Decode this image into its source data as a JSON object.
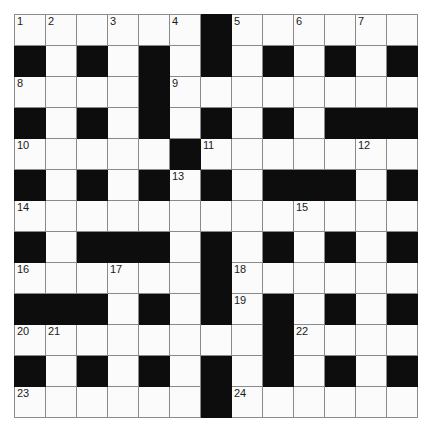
{
  "puzzle": {
    "kind": "crossword-grid",
    "rows": 13,
    "cols": 13,
    "cell_size_px": 30,
    "colors": {
      "block": "#0d0d0d",
      "cell": "#fbfbfb",
      "grid_line": "#8a8a8a",
      "border": "#555555",
      "number_text": "#1a1a1a",
      "page_background": "#ffffff"
    },
    "grid": [
      [
        "white",
        "white",
        "white",
        "white",
        "white",
        "white",
        "black",
        "white",
        "white",
        "white",
        "white",
        "white",
        "white"
      ],
      [
        "black",
        "white",
        "black",
        "white",
        "black",
        "white",
        "black",
        "white",
        "black",
        "white",
        "black",
        "white",
        "black"
      ],
      [
        "white",
        "white",
        "white",
        "white",
        "black",
        "white",
        "white",
        "white",
        "white",
        "white",
        "white",
        "white",
        "white"
      ],
      [
        "black",
        "white",
        "black",
        "white",
        "black",
        "white",
        "black",
        "white",
        "black",
        "white",
        "black",
        "black",
        "black"
      ],
      [
        "white",
        "white",
        "white",
        "white",
        "white",
        "black",
        "white",
        "white",
        "white",
        "white",
        "white",
        "white",
        "white"
      ],
      [
        "black",
        "white",
        "black",
        "white",
        "black",
        "white",
        "black",
        "white",
        "black",
        "black",
        "black",
        "white",
        "black"
      ],
      [
        "white",
        "white",
        "white",
        "white",
        "white",
        "white",
        "white",
        "white",
        "white",
        "white",
        "white",
        "white",
        "white"
      ],
      [
        "black",
        "white",
        "black",
        "black",
        "black",
        "white",
        "black",
        "white",
        "black",
        "white",
        "black",
        "white",
        "black"
      ],
      [
        "white",
        "white",
        "white",
        "white",
        "white",
        "white",
        "black",
        "white",
        "white",
        "white",
        "white",
        "white",
        "white"
      ],
      [
        "black",
        "black",
        "black",
        "white",
        "black",
        "white",
        "black",
        "white",
        "black",
        "white",
        "black",
        "white",
        "black"
      ],
      [
        "white",
        "white",
        "white",
        "white",
        "white",
        "white",
        "white",
        "white",
        "black",
        "white",
        "white",
        "white",
        "white"
      ],
      [
        "black",
        "white",
        "black",
        "white",
        "black",
        "white",
        "black",
        "white",
        "black",
        "white",
        "black",
        "white",
        "black"
      ],
      [
        "white",
        "white",
        "white",
        "white",
        "white",
        "white",
        "black",
        "white",
        "white",
        "white",
        "white",
        "white",
        "white"
      ]
    ],
    "numbers": [
      {
        "row": 1,
        "col": 1,
        "label": "1"
      },
      {
        "row": 1,
        "col": 2,
        "label": "2"
      },
      {
        "row": 1,
        "col": 4,
        "label": "3"
      },
      {
        "row": 1,
        "col": 6,
        "label": "4"
      },
      {
        "row": 1,
        "col": 8,
        "label": "5"
      },
      {
        "row": 1,
        "col": 10,
        "label": "6"
      },
      {
        "row": 1,
        "col": 12,
        "label": "7"
      },
      {
        "row": 3,
        "col": 1,
        "label": "8"
      },
      {
        "row": 3,
        "col": 6,
        "label": "9"
      },
      {
        "row": 5,
        "col": 1,
        "label": "10"
      },
      {
        "row": 5,
        "col": 7,
        "label": "11"
      },
      {
        "row": 5,
        "col": 12,
        "label": "12"
      },
      {
        "row": 6,
        "col": 6,
        "label": "13"
      },
      {
        "row": 7,
        "col": 1,
        "label": "14"
      },
      {
        "row": 7,
        "col": 10,
        "label": "15"
      },
      {
        "row": 9,
        "col": 1,
        "label": "16"
      },
      {
        "row": 9,
        "col": 4,
        "label": "17"
      },
      {
        "row": 9,
        "col": 8,
        "label": "18"
      },
      {
        "row": 10,
        "col": 8,
        "label": "19"
      },
      {
        "row": 11,
        "col": 1,
        "label": "20"
      },
      {
        "row": 11,
        "col": 2,
        "label": "21"
      },
      {
        "row": 11,
        "col": 10,
        "label": "22"
      },
      {
        "row": 13,
        "col": 1,
        "label": "23"
      },
      {
        "row": 13,
        "col": 8,
        "label": "24"
      }
    ]
  }
}
